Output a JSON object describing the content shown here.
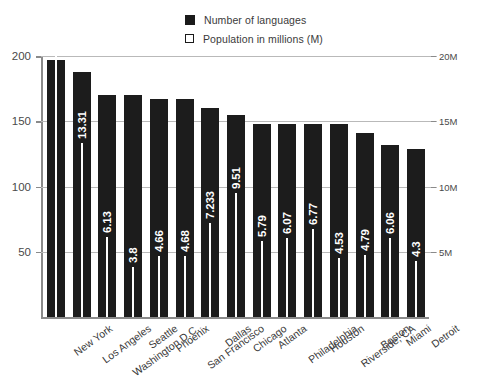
{
  "legend": {
    "items": [
      {
        "label": "Number of languages",
        "swatch": "filled-square-icon",
        "color": "#1a1a1a"
      },
      {
        "label": "Population in millions (M)",
        "swatch": "hollow-square-icon",
        "color": "#ffffff"
      }
    ]
  },
  "axes": {
    "left_ticks": [
      "50",
      "100",
      "150",
      "200"
    ],
    "right_ticks": [
      "5M",
      "10M",
      "15M",
      "20M"
    ]
  },
  "chart_data": {
    "type": "bar",
    "title": "",
    "subtitle": "",
    "xlabel": "",
    "ylabel": "",
    "y2label": "",
    "ylim": [
      0,
      200
    ],
    "y2lim": [
      0,
      20
    ],
    "grid": true,
    "legend_position": "top-center",
    "categories": [
      "New York",
      "Los Angeles",
      "Washington D.C.",
      "Seattle",
      "Phoenix",
      "San Francisco",
      "Dallas",
      "Chicago",
      "Atlanta",
      "Philadelphia",
      "Houston",
      "Riverside, CA",
      "Boston",
      "Miami",
      "Detroit"
    ],
    "series": [
      {
        "name": "Number of languages",
        "axis": "left",
        "values": [
          197,
          188,
          170,
          170,
          167,
          167,
          160,
          155,
          148,
          148,
          148,
          148,
          141,
          132,
          129
        ]
      },
      {
        "name": "Population in millions (M)",
        "axis": "right",
        "values": [
          20.15,
          13.31,
          6.13,
          3.8,
          4.66,
          4.68,
          7.233,
          9.51,
          5.79,
          6.07,
          6.77,
          4.53,
          4.79,
          6.06,
          4.3
        ],
        "labels": [
          "20.15",
          "13.31",
          "6.13",
          "3.8",
          "4.66",
          "4.68",
          "7.233",
          "9.51",
          "5.79",
          "6.07",
          "6.77",
          "4.53",
          "4.79",
          "6.06",
          "4.3"
        ]
      }
    ]
  }
}
